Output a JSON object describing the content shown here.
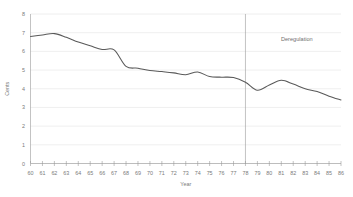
{
  "chart_data": {
    "type": "line",
    "title": "",
    "xlabel": "Year",
    "ylabel": "Cents",
    "xlim": [
      60,
      86
    ],
    "ylim": [
      0,
      8
    ],
    "grid": true,
    "legend": null,
    "x": [
      60,
      61,
      62,
      63,
      64,
      65,
      66,
      67,
      68,
      69,
      70,
      71,
      72,
      73,
      74,
      75,
      76,
      77,
      78,
      79,
      80,
      81,
      82,
      83,
      84,
      85,
      86
    ],
    "xtick_labels": [
      "60",
      "61",
      "62",
      "63",
      "64",
      "65",
      "66",
      "67",
      "68",
      "69",
      "70",
      "71",
      "72",
      "73",
      "74",
      "75",
      "76",
      "77",
      "78",
      "79",
      "80",
      "81",
      "82",
      "83",
      "84",
      "85",
      "86"
    ],
    "ytick_labels": [
      "0",
      "1",
      "2",
      "3",
      "4",
      "5",
      "6",
      "7",
      "8"
    ],
    "ytick_values": [
      0,
      1,
      2,
      3,
      4,
      5,
      6,
      7,
      8
    ],
    "series": [
      {
        "name": "Price",
        "values": [
          6.8,
          6.88,
          6.95,
          6.75,
          6.5,
          6.3,
          6.1,
          6.08,
          5.2,
          5.1,
          4.98,
          4.92,
          4.85,
          4.75,
          4.9,
          4.65,
          4.62,
          4.6,
          4.35,
          3.92,
          4.2,
          4.45,
          4.25,
          4.0,
          3.85,
          3.6,
          3.4
        ]
      }
    ],
    "annotations": [
      {
        "name": "deregulation-marker",
        "label": "Deregulation",
        "x": 78,
        "label_x": 82.3,
        "label_y": 6.55,
        "type": "vline-with-label"
      }
    ]
  },
  "colors": {
    "line": "#595959",
    "grid": "#e2e2e2",
    "axis": "#9a9a9a",
    "text": "#7a7a7a",
    "background": "#ffffff"
  }
}
